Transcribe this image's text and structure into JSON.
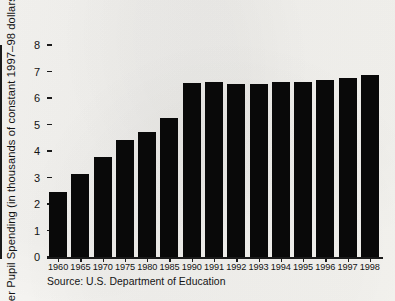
{
  "figure": {
    "source_note": "Source: U.S. Department of Education",
    "ink_color": "#090909",
    "paper_color": "#f4f3f0",
    "axis_color": "#1a1a1a"
  },
  "chart_data": {
    "type": "bar",
    "title": "",
    "xlabel": "",
    "ylabel": "Per Pupil Spending (in thousands of constant 1997–98 dollars)",
    "categories": [
      "1960",
      "1965",
      "1970",
      "1975",
      "1980",
      "1985",
      "1990",
      "1991",
      "1992",
      "1993",
      "1994",
      "1995",
      "1996",
      "1997",
      "1998"
    ],
    "values": [
      2.45,
      3.12,
      3.78,
      4.42,
      4.73,
      5.25,
      6.55,
      6.59,
      6.54,
      6.54,
      6.59,
      6.6,
      6.68,
      6.74,
      6.88
    ],
    "ylim": [
      0,
      8
    ],
    "yticks": [
      "0",
      "1",
      "2",
      "3",
      "4",
      "5",
      "6",
      "7",
      "8"
    ],
    "grid": false,
    "legend": null,
    "series_color": "#090909"
  }
}
